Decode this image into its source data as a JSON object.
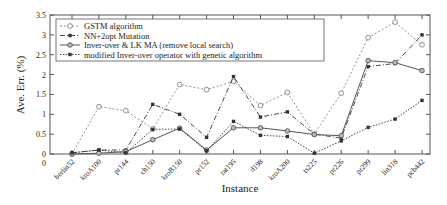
{
  "chart_data": {
    "type": "line",
    "title": "",
    "xlabel": "Instance",
    "ylabel": "Ave. Err. (%)",
    "ylim": [
      0,
      3.5
    ],
    "yticks": [
      "0",
      "0.5",
      "1",
      "1.5",
      "2",
      "2.5",
      "3",
      "3.5"
    ],
    "grid": false,
    "legend_position": "upper left",
    "categories": [
      "berlin52",
      "kroA100",
      "pr144",
      "ch150",
      "kroB150",
      "pr152",
      "rat195",
      "d198",
      "kroA200",
      "ts225",
      "pr226",
      "pr299",
      "lin318",
      "pcb442"
    ],
    "series": [
      {
        "name": "GSTM algorithm",
        "style": "dotted-open-circle",
        "values": [
          0.0,
          1.19,
          1.09,
          0.63,
          1.75,
          1.62,
          1.83,
          1.22,
          1.55,
          0.5,
          1.53,
          2.93,
          3.32,
          2.75
        ]
      },
      {
        "name": "NN+2opt Mutation",
        "style": "dashdot-filled-square",
        "values": [
          0.03,
          0.1,
          0.1,
          1.25,
          1.0,
          0.42,
          1.95,
          0.93,
          1.06,
          0.5,
          0.4,
          2.2,
          2.28,
          3.0
        ]
      },
      {
        "name": "Inver-over & LK MA (remove local search)",
        "style": "solid-circle",
        "values": [
          0.0,
          0.02,
          0.06,
          0.36,
          0.65,
          0.1,
          0.66,
          0.66,
          0.58,
          0.49,
          0.46,
          2.35,
          2.3,
          2.1
        ]
      },
      {
        "name": "modified Inver-over operator with genetic algorithm",
        "style": "dotted-filled-square",
        "values": [
          0.03,
          0.1,
          0.03,
          0.62,
          0.63,
          0.08,
          0.82,
          0.47,
          0.44,
          0.02,
          0.33,
          0.67,
          0.88,
          1.35
        ]
      }
    ]
  }
}
